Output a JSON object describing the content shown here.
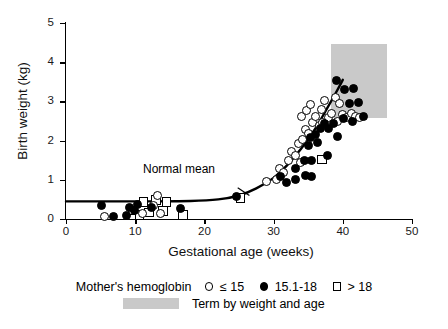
{
  "chart_data": {
    "type": "scatter",
    "title": "",
    "xlabel": "Gestational age (weeks)",
    "ylabel": "Birth weight (kg)",
    "xlim": [
      0,
      50
    ],
    "ylim": [
      0,
      5
    ],
    "xticks": [
      0,
      10,
      20,
      30,
      40,
      50
    ],
    "yticks": [
      0,
      1,
      2,
      3,
      4,
      5
    ],
    "grid": false,
    "legend_position": "bottom",
    "annotations": [
      {
        "text": "Normal mean",
        "x": 22.5,
        "y": 1.05,
        "leader_to": {
          "x": 26.5,
          "y": 0.55
        }
      }
    ],
    "shaded_regions": [
      {
        "label": "Term by weight and age",
        "color": "#c9c9c9",
        "x_range": [
          38.3,
          46.4
        ],
        "y_range": [
          2.57,
          4.47
        ]
      }
    ],
    "reference_curve": {
      "name": "Normal mean",
      "color": "#000000",
      "points": [
        {
          "x": 0.0,
          "y": 0.45
        },
        {
          "x": 10.0,
          "y": 0.45
        },
        {
          "x": 18.0,
          "y": 0.46
        },
        {
          "x": 22.0,
          "y": 0.5
        },
        {
          "x": 25.0,
          "y": 0.6
        },
        {
          "x": 27.5,
          "y": 0.78
        },
        {
          "x": 30.0,
          "y": 1.05
        },
        {
          "x": 32.0,
          "y": 1.38
        },
        {
          "x": 34.0,
          "y": 1.8
        },
        {
          "x": 36.0,
          "y": 2.3
        },
        {
          "x": 37.5,
          "y": 2.75
        },
        {
          "x": 39.0,
          "y": 3.22
        },
        {
          "x": 40.0,
          "y": 3.55
        }
      ]
    },
    "series": [
      {
        "name": "≤ 15",
        "marker": "open-circle",
        "points": [
          {
            "x": 5.6,
            "y": 0.06
          },
          {
            "x": 11.1,
            "y": 0.14
          },
          {
            "x": 12.6,
            "y": 0.35
          },
          {
            "x": 13.6,
            "y": 0.14
          },
          {
            "x": 13.2,
            "y": 0.6
          },
          {
            "x": 29.0,
            "y": 0.95
          },
          {
            "x": 30.4,
            "y": 1.02
          },
          {
            "x": 30.9,
            "y": 1.3
          },
          {
            "x": 31.4,
            "y": 1.18
          },
          {
            "x": 32.1,
            "y": 1.48
          },
          {
            "x": 32.6,
            "y": 1.72
          },
          {
            "x": 33.1,
            "y": 1.62
          },
          {
            "x": 33.6,
            "y": 1.92
          },
          {
            "x": 34.2,
            "y": 2.02
          },
          {
            "x": 34.6,
            "y": 2.28
          },
          {
            "x": 35.1,
            "y": 2.18
          },
          {
            "x": 35.6,
            "y": 2.45
          },
          {
            "x": 34.1,
            "y": 2.62
          },
          {
            "x": 34.8,
            "y": 2.78
          },
          {
            "x": 35.4,
            "y": 2.92
          },
          {
            "x": 36.1,
            "y": 2.62
          },
          {
            "x": 36.6,
            "y": 2.38
          },
          {
            "x": 36.9,
            "y": 2.8
          },
          {
            "x": 37.4,
            "y": 3.02
          },
          {
            "x": 37.9,
            "y": 2.58
          },
          {
            "x": 38.4,
            "y": 2.7
          },
          {
            "x": 38.9,
            "y": 3.1
          },
          {
            "x": 39.5,
            "y": 2.95
          },
          {
            "x": 40.0,
            "y": 2.66
          },
          {
            "x": 40.6,
            "y": 2.6
          },
          {
            "x": 41.2,
            "y": 2.7
          },
          {
            "x": 41.8,
            "y": 2.62
          },
          {
            "x": 42.4,
            "y": 2.58
          },
          {
            "x": 39.2,
            "y": 2.48
          },
          {
            "x": 37.1,
            "y": 2.46
          },
          {
            "x": 33.9,
            "y": 1.44
          }
        ]
      },
      {
        "name": "15.1-18",
        "marker": "filled-circle",
        "points": [
          {
            "x": 5.2,
            "y": 0.34
          },
          {
            "x": 6.8,
            "y": 0.06
          },
          {
            "x": 8.8,
            "y": 0.1
          },
          {
            "x": 9.2,
            "y": 0.3
          },
          {
            "x": 9.9,
            "y": 0.22
          },
          {
            "x": 10.4,
            "y": 0.36
          },
          {
            "x": 12.3,
            "y": 0.3
          },
          {
            "x": 16.6,
            "y": 0.28
          },
          {
            "x": 24.6,
            "y": 0.58
          },
          {
            "x": 31.0,
            "y": 1.08
          },
          {
            "x": 31.9,
            "y": 0.92
          },
          {
            "x": 33.2,
            "y": 1.02
          },
          {
            "x": 34.6,
            "y": 1.12
          },
          {
            "x": 35.5,
            "y": 1.08
          },
          {
            "x": 34.4,
            "y": 1.5
          },
          {
            "x": 35.5,
            "y": 1.48
          },
          {
            "x": 33.1,
            "y": 1.3
          },
          {
            "x": 35.0,
            "y": 1.88
          },
          {
            "x": 35.4,
            "y": 2.08
          },
          {
            "x": 36.0,
            "y": 2.16
          },
          {
            "x": 36.4,
            "y": 1.96
          },
          {
            "x": 36.8,
            "y": 2.32
          },
          {
            "x": 37.4,
            "y": 2.44
          },
          {
            "x": 38.0,
            "y": 2.3
          },
          {
            "x": 38.6,
            "y": 2.44
          },
          {
            "x": 39.2,
            "y": 2.1
          },
          {
            "x": 39.1,
            "y": 3.54
          },
          {
            "x": 40.2,
            "y": 3.3
          },
          {
            "x": 41.6,
            "y": 3.34
          },
          {
            "x": 41.0,
            "y": 2.94
          },
          {
            "x": 42.3,
            "y": 2.96
          },
          {
            "x": 40.1,
            "y": 2.56
          },
          {
            "x": 41.4,
            "y": 2.5
          },
          {
            "x": 43.0,
            "y": 2.62
          },
          {
            "x": 37.8,
            "y": 1.62
          }
        ]
      },
      {
        "name": "> 18",
        "marker": "open-square",
        "points": [
          {
            "x": 9.6,
            "y": 0.22
          },
          {
            "x": 10.6,
            "y": 0.1
          },
          {
            "x": 11.2,
            "y": 0.44
          },
          {
            "x": 12.0,
            "y": 0.16
          },
          {
            "x": 13.0,
            "y": 0.48
          },
          {
            "x": 14.0,
            "y": 0.2
          },
          {
            "x": 14.5,
            "y": 0.44
          },
          {
            "x": 16.9,
            "y": 0.1
          },
          {
            "x": 25.2,
            "y": 0.54
          },
          {
            "x": 37.0,
            "y": 1.52
          }
        ]
      }
    ]
  },
  "legend": {
    "title": "Mother's hemoglobin",
    "entries": [
      {
        "label": "≤ 15",
        "marker": "open-circle"
      },
      {
        "label": "15.1-18",
        "marker": "filled-circle"
      },
      {
        "label": "> 18",
        "marker": "open-square"
      }
    ],
    "shaded_label": "Term by weight and age"
  }
}
